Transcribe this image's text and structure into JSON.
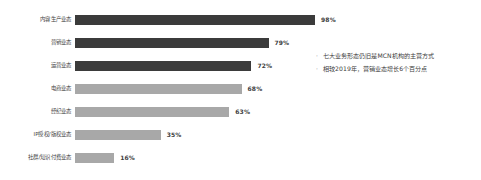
{
  "chart_data": {
    "type": "bar",
    "orientation": "horizontal",
    "title": "",
    "xlabel": "",
    "ylabel": "",
    "xlim": [
      0,
      100
    ],
    "grid": false,
    "legend": null,
    "value_suffix": "%",
    "categories": [
      "内容生产业态",
      "营销业态",
      "运营业态",
      "电商业态",
      "经纪业态",
      "IP授权/版权业态",
      "社群/知识付费业态"
    ],
    "values": [
      98,
      79,
      72,
      68,
      63,
      35,
      16
    ],
    "value_labels": [
      "98%",
      "79%",
      "72%",
      "68%",
      "63%",
      "35%",
      "16%"
    ],
    "bar_colors": [
      "#3b3b3b",
      "#3b3b3b",
      "#3b3b3b",
      "#a8a8a8",
      "#a8a8a8",
      "#a8a8a8",
      "#a8a8a8"
    ],
    "dark_color": "#3b3b3b",
    "light_color": "#a8a8a8"
  },
  "notes": {
    "bullet_glyph": "·",
    "items": [
      "七大业务形态仍旧是MCN机构的主营方式",
      "相较2019年，营销业态增长6个百分点"
    ]
  }
}
